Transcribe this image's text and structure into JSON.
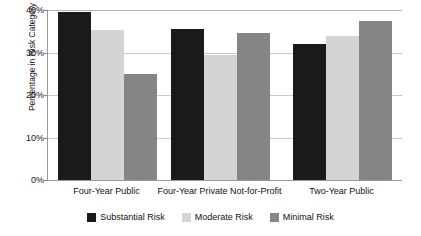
{
  "chart_data": {
    "type": "bar",
    "title": "",
    "xlabel": "",
    "ylabel": "Percentage in Risk Category",
    "categories": [
      "Four-Year Public",
      "Four-Year Private Not-for-Profit",
      "Two-Year Public"
    ],
    "series": [
      {
        "name": "Substantial Risk",
        "color": "#1a1a1a",
        "values": [
          39.5,
          35.5,
          32.0
        ]
      },
      {
        "name": "Moderate Risk",
        "color": "#d4d4d4",
        "values": [
          35.3,
          29.5,
          34.0
        ]
      },
      {
        "name": "Minimal Risk",
        "color": "#858585",
        "values": [
          25.0,
          34.6,
          37.5
        ]
      }
    ],
    "ylim": [
      0,
      40
    ],
    "yticks": [
      0,
      10,
      20,
      30,
      40
    ],
    "ytick_labels": [
      "0%",
      "10%",
      "20%",
      "30%",
      "40%"
    ],
    "grid": true,
    "legend_position": "bottom"
  },
  "axis": {
    "y_title": "Percentage in Risk Category"
  },
  "legend": {
    "items": [
      {
        "label": "Substantial Risk"
      },
      {
        "label": "Moderate Risk"
      },
      {
        "label": "Minimal Risk"
      }
    ]
  }
}
